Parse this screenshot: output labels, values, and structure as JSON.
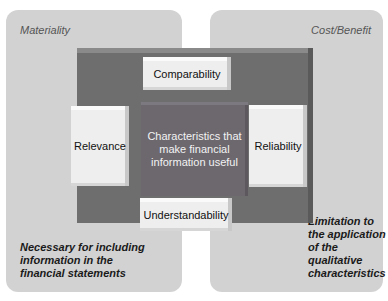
{
  "panels": {
    "left": {
      "title": "Materiality",
      "note": "Necessary for including information in the financial statements"
    },
    "right": {
      "title": "Cost/Benefit",
      "note": "Limitation to the application of the qualitative characteristics"
    }
  },
  "core": {
    "center": "Characteristics that make financial information useful",
    "top": "Comparability",
    "left": "Relevance",
    "right": "Reliability",
    "bottom": "Understandability"
  },
  "colors": {
    "panel": "#d2d2d2",
    "frame": "#6e6e6e",
    "center": "#6c686e",
    "box": "#eeeeee"
  }
}
